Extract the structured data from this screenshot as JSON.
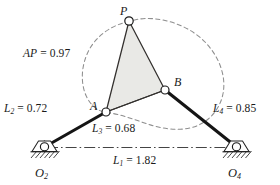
{
  "figure": {
    "type": "four-bar-linkage-mechanism-diagram",
    "background_color": "#ffffff",
    "ink_color": "#1a1a1a",
    "coupler_fill_color": "#e9e9e6",
    "dashed_curve_color": "#8a8a8a"
  },
  "dimension_labels": [
    {
      "id": "AP",
      "name": "coupler-point-distance",
      "base": "AP",
      "sub": "",
      "value": "0.97",
      "text": "AP = 0.97",
      "x": 23,
      "y": 48
    },
    {
      "id": "L2",
      "name": "crank-length",
      "base": "L",
      "sub": "2",
      "value": "0.72",
      "text": "L2 = 0.72",
      "x": 4,
      "y": 103
    },
    {
      "id": "L4",
      "name": "rocker-length",
      "base": "L",
      "sub": "4",
      "value": "0.85",
      "text": "L4 = 0.85",
      "x": 213,
      "y": 103
    },
    {
      "id": "L3",
      "name": "coupler-length",
      "base": "L",
      "sub": "3",
      "value": "0.68",
      "text": "L3 = 0.68",
      "x": 92,
      "y": 123
    },
    {
      "id": "L1",
      "name": "ground-length",
      "base": "L",
      "sub": "1",
      "value": "1.82",
      "text": "L1 = 1.82",
      "x": 113,
      "y": 155
    }
  ],
  "joint_labels": [
    {
      "id": "P",
      "name": "coupler-point-label",
      "base": "P",
      "sub": "",
      "text": "P",
      "x": 120,
      "y": 5
    },
    {
      "id": "A",
      "name": "joint-a-label",
      "base": "A",
      "sub": "",
      "text": "A",
      "x": 90,
      "y": 100
    },
    {
      "id": "B",
      "name": "joint-b-label",
      "base": "B",
      "sub": "",
      "text": "B",
      "x": 174,
      "y": 76
    },
    {
      "id": "O2",
      "name": "ground-pivot-o2-label",
      "base": "O",
      "sub": "2",
      "text": "O2",
      "x": 35,
      "y": 167
    },
    {
      "id": "O4",
      "name": "ground-pivot-o4-label",
      "base": "O",
      "sub": "4",
      "text": "O4",
      "x": 228,
      "y": 167
    }
  ],
  "geometry": {
    "points": {
      "O2": {
        "x": 44,
        "y": 147
      },
      "O4": {
        "x": 237,
        "y": 147
      },
      "A": {
        "x": 106,
        "y": 112
      },
      "B": {
        "x": 165,
        "y": 90
      },
      "P": {
        "x": 129,
        "y": 21
      }
    },
    "links": [
      {
        "name": "link-L2-crank",
        "from": "O2",
        "to": "A",
        "style": "thick-solid"
      },
      {
        "name": "link-L3-coupler",
        "from": "A",
        "to": "B",
        "style": "thin-solid"
      },
      {
        "name": "link-L4-rocker",
        "from": "B",
        "to": "O4",
        "style": "thick-solid"
      },
      {
        "name": "link-L1-ground",
        "from": "O2",
        "to": "O4",
        "style": "dash-dot-centerline"
      }
    ],
    "coupler_triangle": [
      "A",
      "B",
      "P"
    ]
  }
}
